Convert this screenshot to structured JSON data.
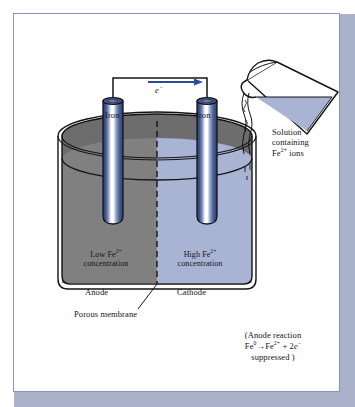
{
  "figure": {
    "labels": {
      "iron_left": "Iron",
      "iron_right": "Iron",
      "electron": "e−",
      "electron_symbol": "e",
      "electron_charge": "−",
      "low_concentration_line1": "Low  Fe",
      "low_concentration_charge": "2+",
      "low_concentration_line2": "concentration",
      "high_concentration_line1": "High  Fe",
      "high_concentration_charge": "2+",
      "high_concentration_line2": "concentration",
      "anode": "Anode",
      "cathode": "Cathode",
      "porous_membrane": "Porous membrane",
      "solution_line1": "Solution",
      "solution_line2": "containing",
      "solution_line3_pre": "Fe",
      "solution_line3_charge": "2+",
      "solution_line3_post": " ions",
      "reaction_line1": "(Anode reaction",
      "reaction_fe0": "Fe",
      "reaction_fe0_sup": "0",
      "reaction_arrow": "→",
      "reaction_fe2_pre": "Fe",
      "reaction_fe2_sup": "2+",
      "reaction_plus": " + 2",
      "reaction_e": "e",
      "reaction_e_sup": "−",
      "reaction_line3": "suppressed )"
    },
    "colors": {
      "anode_solution": "#808080",
      "cathode_solution": "#a9b3d3",
      "liquid_surface_dark": "#6d6d6d",
      "electrode_dark": "#2d3f72",
      "electrode_mid": "#7488b8",
      "electrode_highlight": "#ffffff",
      "flask_liquid": "#a9b3d3",
      "outline": "#141414",
      "arrow": "#2c4a9a",
      "frame_border": "#8d93ad",
      "page_shadow": "#aab2cb",
      "background": "#ffffff"
    }
  }
}
